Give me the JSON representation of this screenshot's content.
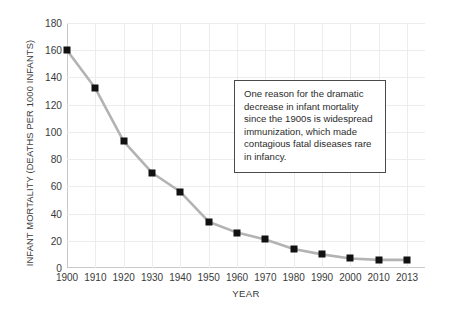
{
  "chart_data": {
    "type": "line",
    "title": "",
    "xlabel": "YEAR",
    "ylabel": "INFANT MORTALITY (DEATHS PER 1000 INFANTS)",
    "categories": [
      "1900",
      "1910",
      "1920",
      "1930",
      "1940",
      "1950",
      "1960",
      "1970",
      "1980",
      "1990",
      "2000",
      "2010",
      "2013"
    ],
    "x": [
      1900,
      1910,
      1920,
      1930,
      1940,
      1950,
      1960,
      1970,
      1980,
      1990,
      2000,
      2010,
      2013
    ],
    "values": [
      160,
      132,
      93,
      70,
      56,
      34,
      26,
      21,
      14,
      10,
      7,
      6,
      6
    ],
    "series": [
      {
        "name": "Infant mortality",
        "values": [
          160,
          132,
          93,
          70,
          56,
          34,
          26,
          21,
          14,
          10,
          7,
          6,
          6
        ]
      }
    ],
    "ylim": [
      0,
      180
    ],
    "yticks": [
      0,
      20,
      40,
      60,
      80,
      100,
      120,
      140,
      160,
      180
    ],
    "ytick_labels": [
      "0",
      "20",
      "40",
      "60",
      "80",
      "100",
      "120",
      "140",
      "160",
      "180"
    ],
    "xtick_labels": [
      "1900",
      "1910",
      "1920",
      "1930",
      "1940",
      "1950",
      "1960",
      "1970",
      "1980",
      "1990",
      "2000",
      "2010",
      "2013"
    ],
    "grid": true,
    "legend": "none",
    "line_color": "#b3b3b3",
    "marker_color": "#111111",
    "grid_color": "#ececec",
    "axis_color": "#c9c9c9",
    "background_color": "#ffffff",
    "annotations": [
      {
        "text": "One reason for the dramatic decrease in infant mortality since the 1900s is widespread immunization, which made contagious fatal diseases rare in infancy."
      }
    ]
  }
}
